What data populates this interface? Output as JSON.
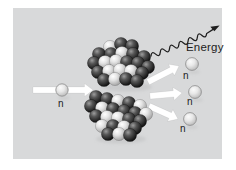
{
  "figure": {
    "type": "nuclear-fission-diagram",
    "labels": {
      "energy": "Energy",
      "incoming_neutron": "n",
      "emitted_neutron_1": "n",
      "emitted_neutron_2": "n",
      "emitted_neutron_3": "n"
    },
    "colors": {
      "page_bg": "#ffffff",
      "panel_bg": "#d8d9da",
      "arrow_fill": "#ffffff",
      "dark_nucleon": "#2b2b2b",
      "light_nucleon": "#dcdcdc",
      "neutron_sphere": "#d0d0d0",
      "text": "#1c1c1c",
      "energy_wave": "#1e1e1e"
    },
    "incoming_neutron": {
      "x": 62,
      "y": 90,
      "r": 6.2
    },
    "emitted_neutrons": [
      {
        "x": 192,
        "y": 64,
        "r": 6.4
      },
      {
        "x": 195,
        "y": 92,
        "r": 6.4
      },
      {
        "x": 190,
        "y": 119,
        "r": 6.4
      }
    ],
    "arrows": [
      {
        "name": "incoming-neutron-arrow",
        "x1": 33,
        "y1": 90,
        "x2": 93,
        "y2": 90
      },
      {
        "name": "emitted-arrow-top",
        "x1": 148,
        "y1": 82,
        "x2": 179,
        "y2": 66
      },
      {
        "name": "emitted-arrow-middle",
        "x1": 150,
        "y1": 96,
        "x2": 182,
        "y2": 93
      },
      {
        "name": "emitted-arrow-bottom",
        "x1": 149,
        "y1": 106,
        "x2": 178,
        "y2": 119
      }
    ],
    "fragments": {
      "upper": [
        {
          "x": 110,
          "y": 47,
          "c": "light"
        },
        {
          "x": 121,
          "y": 44,
          "c": "dark"
        },
        {
          "x": 132,
          "y": 46,
          "c": "dark"
        },
        {
          "x": 99,
          "y": 54,
          "c": "dark"
        },
        {
          "x": 111,
          "y": 54,
          "c": "dark"
        },
        {
          "x": 122,
          "y": 53,
          "c": "light"
        },
        {
          "x": 133,
          "y": 54,
          "c": "dark"
        },
        {
          "x": 144,
          "y": 57,
          "c": "dark"
        },
        {
          "x": 94,
          "y": 63,
          "c": "dark"
        },
        {
          "x": 105,
          "y": 62,
          "c": "light"
        },
        {
          "x": 116,
          "y": 61,
          "c": "light"
        },
        {
          "x": 127,
          "y": 62,
          "c": "dark"
        },
        {
          "x": 138,
          "y": 63,
          "c": "dark"
        },
        {
          "x": 148,
          "y": 67,
          "c": "dark"
        },
        {
          "x": 98,
          "y": 72,
          "c": "dark"
        },
        {
          "x": 109,
          "y": 71,
          "c": "light"
        },
        {
          "x": 120,
          "y": 70,
          "c": "light"
        },
        {
          "x": 131,
          "y": 71,
          "c": "light"
        },
        {
          "x": 142,
          "y": 73,
          "c": "dark"
        },
        {
          "x": 104,
          "y": 80,
          "c": "dark"
        },
        {
          "x": 115,
          "y": 79,
          "c": "light"
        },
        {
          "x": 126,
          "y": 79,
          "c": "dark"
        },
        {
          "x": 137,
          "y": 81,
          "c": "dark"
        }
      ],
      "lower": [
        {
          "x": 96,
          "y": 97,
          "c": "dark"
        },
        {
          "x": 107,
          "y": 99,
          "c": "dark"
        },
        {
          "x": 118,
          "y": 101,
          "c": "light"
        },
        {
          "x": 129,
          "y": 103,
          "c": "dark"
        },
        {
          "x": 140,
          "y": 106,
          "c": "light"
        },
        {
          "x": 91,
          "y": 106,
          "c": "dark"
        },
        {
          "x": 102,
          "y": 108,
          "c": "light"
        },
        {
          "x": 113,
          "y": 109,
          "c": "dark"
        },
        {
          "x": 124,
          "y": 111,
          "c": "dark"
        },
        {
          "x": 135,
          "y": 113,
          "c": "dark"
        },
        {
          "x": 146,
          "y": 114,
          "c": "light"
        },
        {
          "x": 96,
          "y": 116,
          "c": "dark"
        },
        {
          "x": 107,
          "y": 117,
          "c": "light"
        },
        {
          "x": 118,
          "y": 118,
          "c": "light"
        },
        {
          "x": 129,
          "y": 119,
          "c": "dark"
        },
        {
          "x": 140,
          "y": 121,
          "c": "dark"
        },
        {
          "x": 102,
          "y": 126,
          "c": "light"
        },
        {
          "x": 113,
          "y": 126,
          "c": "dark"
        },
        {
          "x": 124,
          "y": 127,
          "c": "light"
        },
        {
          "x": 135,
          "y": 128,
          "c": "dark"
        },
        {
          "x": 108,
          "y": 134,
          "c": "dark"
        },
        {
          "x": 119,
          "y": 134,
          "c": "light"
        },
        {
          "x": 130,
          "y": 135,
          "c": "dark"
        }
      ]
    }
  }
}
